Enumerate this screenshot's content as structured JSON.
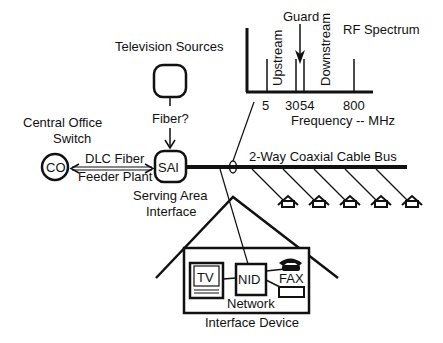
{
  "spectrum": {
    "title": "RF Spectrum",
    "guard_label": "Guard",
    "upstream_label": "Upstream",
    "downstream_label": "Downstream",
    "ticks": [
      "5",
      "30",
      "54",
      "800"
    ],
    "xlabel": "Frequency -- MHz"
  },
  "nodes": {
    "tv_sources_label": "Television Sources",
    "fiber_label": "Fiber?",
    "co_label_line1": "Central Office",
    "co_label_line2": "Switch",
    "co_text": "CO",
    "sai_text": "SAI",
    "sai_label_line1": "Serving Area",
    "sai_label_line2": "Interface",
    "dlc_line1": "DLC Fiber",
    "dlc_line2": "Feeder Plant",
    "bus_label": "2-Way Coaxial Cable Bus"
  },
  "house": {
    "tv_text": "TV",
    "nid_text": "NID",
    "fax_text": "FAX",
    "nid_label_line1": "Network",
    "nid_label_line2": "Interface Device"
  },
  "colors": {
    "stroke": "#111111",
    "background": "#ffffff"
  }
}
